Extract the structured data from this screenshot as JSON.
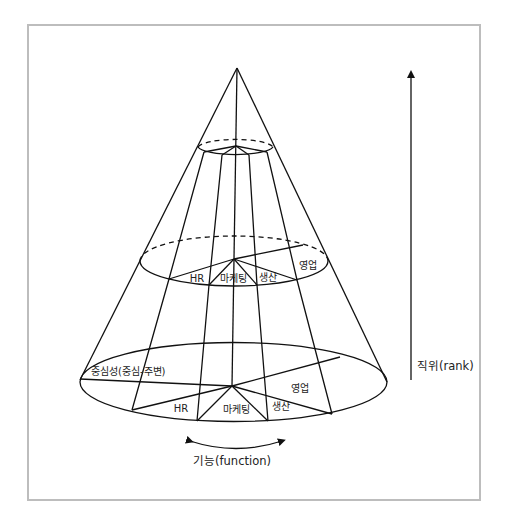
{
  "diagram": {
    "title": "",
    "type": "cone-organizational-model",
    "axes": {
      "rank": {
        "label": "직위(rank)",
        "direction": "up"
      },
      "function": {
        "label": "기능(function)",
        "direction": "bidirectional-curved"
      },
      "centrality": {
        "label": "중심성(중심-주변)"
      }
    },
    "levels": {
      "middle": {
        "sectors": [
          {
            "id": "hr",
            "label": "HR"
          },
          {
            "id": "marketing",
            "label": "마케팅"
          },
          {
            "id": "production",
            "label": "생산"
          },
          {
            "id": "sales",
            "label": "영업"
          }
        ]
      },
      "bottom": {
        "sectors": [
          {
            "id": "hr",
            "label": "HR"
          },
          {
            "id": "marketing",
            "label": "마케팅"
          },
          {
            "id": "production",
            "label": "생산"
          },
          {
            "id": "sales",
            "label": "영업"
          }
        ]
      }
    },
    "colors": {
      "line": "#111111",
      "frame": "#bdbdbd",
      "text": "#222222",
      "background": "#ffffff"
    }
  }
}
